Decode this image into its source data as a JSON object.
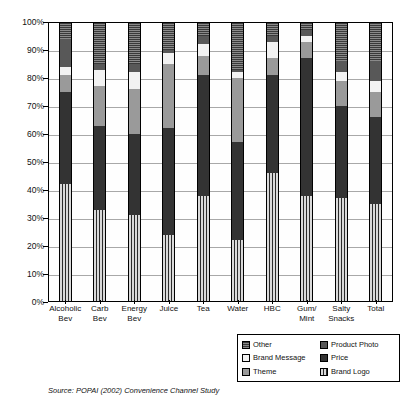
{
  "chart_data": {
    "type": "bar",
    "subtype": "stacked-bar-100-percent",
    "title": "",
    "xlabel": "",
    "ylabel": "",
    "ylim": [
      0,
      100
    ],
    "grid": true,
    "legend_position": "bottom-right",
    "categories": [
      "Alcoholic Bev",
      "Carb Bev",
      "Energy Bev",
      "Juice",
      "Tea",
      "Water",
      "HBC",
      "Gum/ Mint",
      "Salty Snacks",
      "Total"
    ],
    "category_lines": [
      [
        "Alcoholic",
        "Bev"
      ],
      [
        "Carb",
        "Bev"
      ],
      [
        "Energy",
        "Bev"
      ],
      [
        "Juice"
      ],
      [
        "Tea"
      ],
      [
        "Water"
      ],
      [
        "HBC"
      ],
      [
        "Gum/",
        "Mint"
      ],
      [
        "Salty",
        "Snacks"
      ],
      [
        "Total"
      ]
    ],
    "ytick_labels": [
      "0%",
      "10%",
      "20%",
      "30%",
      "40%",
      "50%",
      "60%",
      "70%",
      "80%",
      "90%",
      "100%"
    ],
    "ytick_values": [
      0,
      10,
      20,
      30,
      40,
      50,
      60,
      70,
      80,
      90,
      100
    ],
    "stack_order": [
      "Brand Logo",
      "Price",
      "Theme",
      "Brand Message",
      "Product Photo",
      "Other"
    ],
    "series": [
      {
        "name": "Brand Logo",
        "key": "brand-logo",
        "color": "#d9d9d9",
        "pattern": "vertical-stripes",
        "values": [
          42,
          33,
          31,
          24,
          38,
          22,
          46,
          38,
          37,
          35
        ]
      },
      {
        "name": "Price",
        "key": "price",
        "color": "#333333",
        "pattern": "solid-dark",
        "values": [
          33,
          30,
          29,
          38,
          43,
          35,
          35,
          49,
          33,
          31
        ]
      },
      {
        "name": "Theme",
        "key": "theme",
        "color": "#9a9a9a",
        "pattern": "solid-mid-gray",
        "values": [
          6,
          14,
          16,
          23,
          7,
          23,
          6,
          6,
          9,
          9
        ]
      },
      {
        "name": "Brand Message",
        "key": "brand-message",
        "color": "#f2f2f2",
        "pattern": "solid-light",
        "values": [
          3,
          6,
          6,
          4,
          4,
          2,
          6,
          2,
          3,
          4
        ]
      },
      {
        "name": "Product Photo",
        "key": "product-photo",
        "color": "#585858",
        "pattern": "solid-dark-gray",
        "values": [
          10,
          2,
          3,
          1,
          3,
          1,
          2,
          2,
          4,
          7
        ]
      },
      {
        "name": "Other",
        "key": "other",
        "color": "#4a4a4a",
        "pattern": "horizontal-hatch",
        "values": [
          6,
          15,
          15,
          10,
          5,
          17,
          5,
          3,
          14,
          14
        ]
      }
    ]
  },
  "legend": {
    "items": [
      {
        "label": "Other",
        "key": "other"
      },
      {
        "label": "Product Photo",
        "key": "product-photo"
      },
      {
        "label": "Brand Message",
        "key": "brand-message"
      },
      {
        "label": "Price",
        "key": "price"
      },
      {
        "label": "Theme",
        "key": "theme"
      },
      {
        "label": "Brand Logo",
        "key": "brand-logo"
      }
    ]
  },
  "footer": {
    "source": "Source:  POPAI (2002) Convenience Channel Study"
  }
}
